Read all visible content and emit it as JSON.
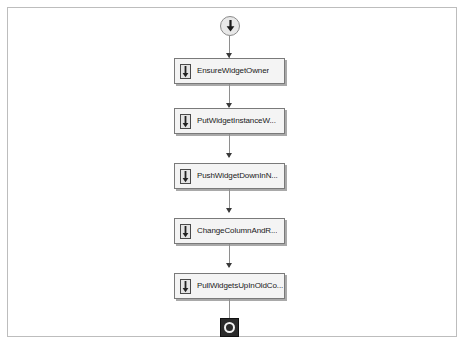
{
  "diagram": {
    "type": "uml-activity-diagram",
    "background_color": "#ffffff",
    "frame_border_color": "#bdbdbd",
    "node_fill_color": "#f4f4f4",
    "node_border_color": "#7a7a7a",
    "connector_color": "#8e8e8e",
    "end_node_color": "#2b2b2b",
    "start_node": {
      "name": "initial-node",
      "icon": "down-arrow-in-circle-icon"
    },
    "end_node": {
      "name": "final-node",
      "icon": "stop-ring-icon"
    },
    "actions": [
      {
        "label": "EnsureWidgetOwner",
        "icon": "activity-arrow-icon"
      },
      {
        "label": "PutWidgetInstanceW...",
        "icon": "activity-arrow-icon"
      },
      {
        "label": "PushWidgetDownInN...",
        "icon": "activity-arrow-icon"
      },
      {
        "label": "ChangeColumnAndR...",
        "icon": "activity-arrow-icon"
      },
      {
        "label": "PullWidgetsUpInOldCo...",
        "icon": "activity-arrow-icon"
      }
    ]
  }
}
